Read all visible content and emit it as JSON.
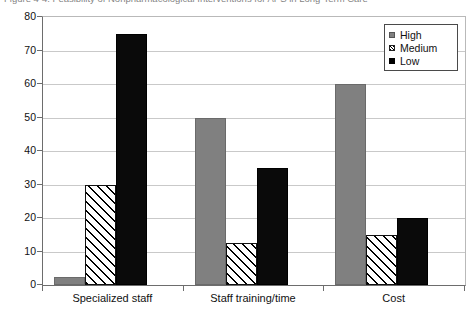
{
  "figure": {
    "caption": "Figure 4-4. Feasibility of Nonpharmacological Interventions for APS in Long-Term Care"
  },
  "chart_data": {
    "type": "bar",
    "title": "",
    "xlabel": "",
    "ylabel": "",
    "ylim": [
      0,
      80
    ],
    "yticks": [
      "0",
      "10",
      "20",
      "30",
      "40",
      "50",
      "60",
      "70",
      "80"
    ],
    "ytick_values": [
      0,
      10,
      20,
      30,
      40,
      50,
      60,
      70,
      80
    ],
    "grid": true,
    "legend_position": "top-right",
    "categories": [
      "Specialized staff",
      "Staff training/time",
      "Cost"
    ],
    "series": [
      {
        "name": "High",
        "style": "solid-gray",
        "color": "#808080",
        "values": [
          2.5,
          50,
          60
        ]
      },
      {
        "name": "Medium",
        "style": "diagonal-hatch",
        "color": "#ffffff",
        "values": [
          30,
          12.5,
          15
        ]
      },
      {
        "name": "Low",
        "style": "solid-black",
        "color": "#000000",
        "values": [
          75,
          35,
          20
        ]
      }
    ]
  },
  "legend": {
    "items": [
      {
        "label": "High",
        "swatch": "gray-square-icon"
      },
      {
        "label": "Medium",
        "swatch": "hatched-square-icon"
      },
      {
        "label": "Low",
        "swatch": "black-square-icon"
      }
    ]
  }
}
